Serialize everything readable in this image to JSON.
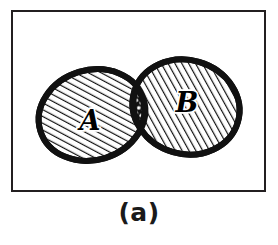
{
  "figure": {
    "caption": "(a)",
    "type": "venn-diagram",
    "background_color": "#ffffff",
    "frame": {
      "border_color": "#231f20",
      "border_width_px": 2,
      "fill": "#ffffff"
    },
    "sets": [
      {
        "id": "set-a",
        "label": "A",
        "label_x": 88,
        "label_y": 110,
        "fill_pattern": "diagonal-hatch",
        "outline_color": "#111111",
        "outline_width_px": 6,
        "center_x": 90,
        "center_y": 113,
        "radius_x": 54,
        "radius_y": 45,
        "rotation_deg": -17
      },
      {
        "id": "set-b",
        "label": "B",
        "label_x": 185,
        "label_y": 100,
        "fill_pattern": "diagonal-hatch",
        "outline_color": "#111111",
        "outline_width_px": 6,
        "center_x": 184,
        "center_y": 105,
        "radius_x": 54,
        "radius_y": 47,
        "rotation_deg": 16
      }
    ],
    "intersection": {
      "id": "set-a-intersect-b",
      "fill_pattern": "dot-grid-on-black",
      "fill_color": "#111111",
      "dot_color": "#ffffff",
      "top_cusp_x": 128,
      "top_cusp_y": 56,
      "bottom_cusp_x": 146,
      "bottom_cusp_y": 150
    },
    "hatch": {
      "angle_deg": 45,
      "spacing_px": 6,
      "line_color": "#111111",
      "line_width_px": 2.4,
      "background": "#ffffff"
    }
  }
}
